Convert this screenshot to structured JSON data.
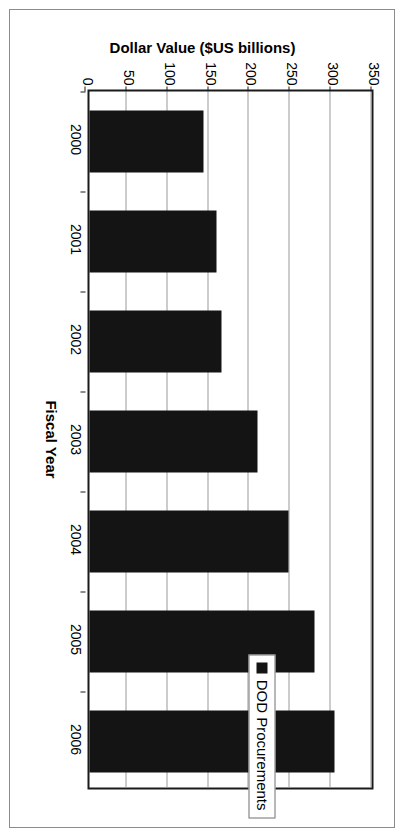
{
  "chart_data": {
    "type": "bar",
    "title": "",
    "xlabel": "Fiscal Year",
    "ylabel": "Dollar Value ($US billions)",
    "categories": [
      "2000",
      "2001",
      "2002",
      "2003",
      "2004",
      "2005",
      "2006"
    ],
    "values": [
      140,
      155,
      162,
      206,
      244,
      275,
      300
    ],
    "series": [
      {
        "name": "DOD Procurements",
        "color": "#141414",
        "values": [
          140,
          155,
          162,
          206,
          244,
          275,
          300
        ]
      }
    ],
    "ylim": [
      0,
      350
    ],
    "yticks": [
      0,
      50,
      100,
      150,
      200,
      250,
      300,
      350
    ],
    "ytick_labels": [
      "0",
      "50",
      "100",
      "150",
      "200",
      "250",
      "300",
      "350"
    ],
    "grid": true,
    "grid_axis": "y",
    "legend_position": "right",
    "orientation": "rotated-90-clockwise"
  },
  "legend": {
    "entries": [
      {
        "label": "DOD Procurements",
        "swatch": "legend-swatch-black"
      }
    ]
  },
  "colors": {
    "bar": "#141414",
    "gridline": "#9a9a9a",
    "axis": "#1a1a1a",
    "page_border": "#8c8c8c",
    "background": "#ffffff",
    "text": "#000000"
  }
}
